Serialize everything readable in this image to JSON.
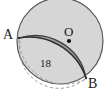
{
  "figure": {
    "colors": {
      "circle_fill": "#d6d6d6",
      "segment_fill": "#9c9c9c",
      "stroke": "#3a3a3a",
      "dashed_stroke": "#8c8c8c",
      "label_color": "#1a1a1a",
      "background": "#ffffff"
    },
    "labels": {
      "point_a": "A",
      "point_b": "B",
      "center_o": "O",
      "measure_18": "18"
    },
    "geometry": {
      "circle_center_x": 60,
      "circle_center_y": 41,
      "circle_radius": 43,
      "point_a_x": 19,
      "point_a_y": 38,
      "point_b_x": 86,
      "point_b_y": 78,
      "center_dot_x": 69,
      "center_dot_y": 41,
      "chord_label": "18"
    }
  }
}
